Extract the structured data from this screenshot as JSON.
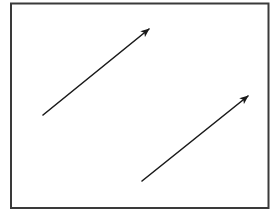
{
  "diagram": {
    "background": "#ffffff",
    "frame": {
      "x": 11,
      "y": 3.5,
      "width": 257.5,
      "height": 204.5,
      "stroke": "#3a3a3a",
      "stroke_width": 2
    },
    "arrows": [
      {
        "id": "arrow-1",
        "x1": 43,
        "y1": 115,
        "x2": 149,
        "y2": 29,
        "stroke": "#1a1a1a",
        "stroke_width": 1.6
      },
      {
        "id": "arrow-2",
        "x1": 142,
        "y1": 181,
        "x2": 248,
        "y2": 96,
        "stroke": "#1a1a1a",
        "stroke_width": 1.6
      }
    ]
  }
}
